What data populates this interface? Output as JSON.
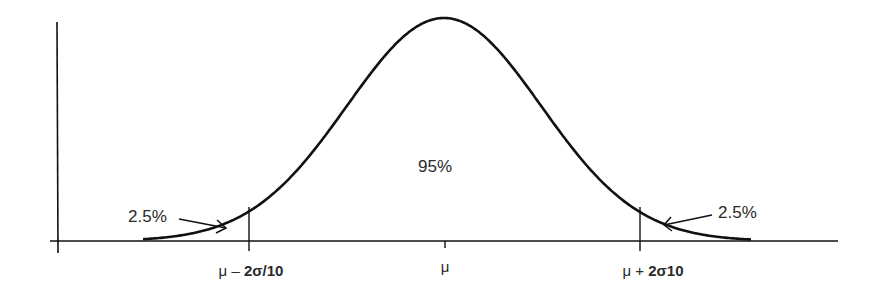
{
  "chart_data": {
    "type": "line",
    "title": "",
    "xlabel": "",
    "ylabel": "",
    "grid": false,
    "legend": null,
    "x_ticks": [
      {
        "position": "mu - 2sigma",
        "label_prefix": "μ – ",
        "label_bold": "2σ/10"
      },
      {
        "position": "mu",
        "label_prefix": "μ",
        "label_bold": ""
      },
      {
        "position": "mu + 2sigma",
        "label_prefix": "μ + ",
        "label_bold": "2σ10"
      }
    ],
    "regions": [
      {
        "name": "left tail",
        "percent": "2.5%"
      },
      {
        "name": "center",
        "percent": "95%"
      },
      {
        "name": "right tail",
        "percent": "2.5%"
      }
    ],
    "annotations": {
      "center": "95%",
      "left_tail": "2.5%",
      "right_tail": "2.5%"
    },
    "series": [
      {
        "name": "normal density",
        "x": [
          -3,
          -2,
          -1,
          0,
          1,
          2,
          3
        ],
        "values": [
          0.004,
          0.054,
          0.242,
          0.399,
          0.242,
          0.054,
          0.004
        ]
      }
    ],
    "colors": {
      "line": "#111111",
      "text": "#2a2a2a",
      "background": "#ffffff"
    }
  }
}
